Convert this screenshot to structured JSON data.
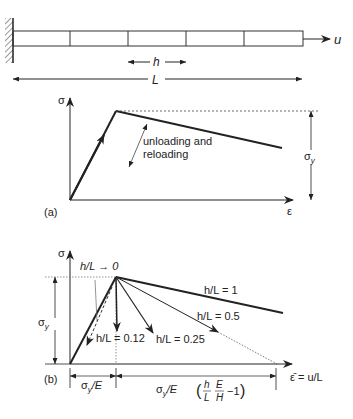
{
  "bar": {
    "elements": 5,
    "load_label": "u",
    "element_label": "h",
    "length_label": "L"
  },
  "graph_a": {
    "panel_label": "(a)",
    "y_axis": "σ",
    "x_axis": "ε",
    "annotation_line1": "unloading and",
    "annotation_line2": "reloading",
    "yield_label": "σ",
    "yield_sub": "y"
  },
  "graph_b": {
    "panel_label": "(b)",
    "y_axis": "σ",
    "x_axis": "ε̄ = u/L",
    "yield_label": "σ",
    "yield_sub": "y",
    "curves": [
      {
        "label": "h/L → 0"
      },
      {
        "label": "h/L = 0.12"
      },
      {
        "label": "h/L = 0.25"
      },
      {
        "label": "h/L = 0.5"
      },
      {
        "label": "h/L = 1"
      }
    ],
    "dim_left": "σ",
    "dim_left_sub": "y",
    "dim_left_rest": "/E",
    "dim_right_prefix": "σ",
    "dim_right_sub": "y",
    "dim_right_mid": "/E",
    "frac1_num": "h",
    "frac1_den": "L",
    "frac2_num": "E",
    "frac2_den": "H",
    "dim_right_suffix": "−1"
  }
}
